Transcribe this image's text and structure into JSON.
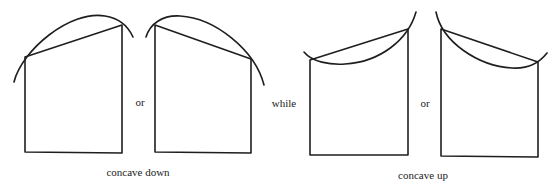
{
  "figures": [
    {
      "id": "concave-down-increasing",
      "group": "concave down"
    },
    {
      "id": "concave-down-decreasing",
      "group": "concave down"
    },
    {
      "id": "concave-up-increasing",
      "group": "concave up"
    },
    {
      "id": "concave-up-decreasing",
      "group": "concave up"
    }
  ],
  "connectors": {
    "or_1": "or",
    "while": "while",
    "or_2": "or"
  },
  "captions": {
    "concave_down": "concave down",
    "concave_up": "concave up"
  },
  "colors": {
    "line": "#1e1e1e",
    "text": "#222222",
    "background": "#ffffff"
  }
}
